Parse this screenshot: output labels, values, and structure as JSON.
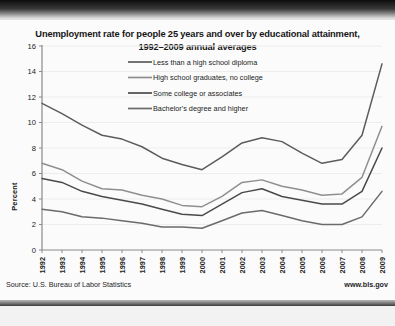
{
  "chart_data": {
    "type": "line",
    "title": "Unemployment rate for people 25 years and over by educational attainment, 1992–2009 annual averages",
    "title_line1": "Unemployment rate for people 25 years and over by educational attainment,",
    "title_line2": "1992–2009 annual averages",
    "xlabel": "",
    "ylabel": "Percent",
    "ylim": [
      0,
      16
    ],
    "ytick_step": 2,
    "yticks": [
      "0",
      "2",
      "4",
      "6",
      "8",
      "10",
      "12",
      "14",
      "16"
    ],
    "grid": true,
    "legend_position": "inside-top-center",
    "categories": [
      "1992",
      "1993",
      "1994",
      "1995",
      "1996",
      "1997",
      "1998",
      "1999",
      "2000",
      "2001",
      "2002",
      "2003",
      "2004",
      "2005",
      "2006",
      "2007",
      "2008",
      "2009"
    ],
    "series": [
      {
        "name": "Less than a high school diploma",
        "color": "#5c5c5c",
        "values": [
          11.5,
          10.7,
          9.8,
          9.0,
          8.7,
          8.1,
          7.2,
          6.7,
          6.3,
          7.3,
          8.4,
          8.8,
          8.5,
          7.6,
          6.8,
          7.1,
          9.0,
          14.6
        ]
      },
      {
        "name": "High school graduates, no college",
        "color": "#8f8f8f",
        "values": [
          6.8,
          6.3,
          5.4,
          4.8,
          4.7,
          4.3,
          4.0,
          3.5,
          3.4,
          4.2,
          5.3,
          5.5,
          5.0,
          4.7,
          4.3,
          4.4,
          5.7,
          9.7
        ]
      },
      {
        "name": "Some college or associates",
        "color": "#4a4a4a",
        "values": [
          5.6,
          5.3,
          4.6,
          4.2,
          3.9,
          3.6,
          3.2,
          2.8,
          2.7,
          3.6,
          4.5,
          4.8,
          4.2,
          3.9,
          3.6,
          3.6,
          4.6,
          8.0
        ]
      },
      {
        "name": "Bachelor's degree and higher",
        "color": "#6b6b6b",
        "values": [
          3.2,
          3.0,
          2.6,
          2.5,
          2.3,
          2.1,
          1.8,
          1.8,
          1.7,
          2.3,
          2.9,
          3.1,
          2.7,
          2.3,
          2.0,
          2.0,
          2.6,
          4.6
        ]
      }
    ]
  },
  "footer": {
    "source": "Source: U.S. Bureau of Labor Statistics",
    "website": "www.bls.gov"
  }
}
